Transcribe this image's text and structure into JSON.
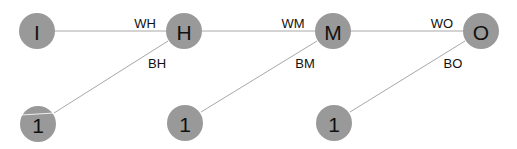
{
  "diagram": {
    "nodes": [
      {
        "id": "I",
        "label": "I",
        "cx": 37,
        "cy": 31,
        "r": 18
      },
      {
        "id": "H",
        "label": "H",
        "cx": 184,
        "cy": 31,
        "r": 18
      },
      {
        "id": "M",
        "label": "M",
        "cx": 333,
        "cy": 31,
        "r": 18
      },
      {
        "id": "O",
        "label": "O",
        "cx": 481,
        "cy": 31,
        "r": 18
      },
      {
        "id": "B1",
        "label": "1",
        "cx": 38,
        "cy": 124,
        "r": 18
      },
      {
        "id": "B2",
        "label": "1",
        "cx": 185,
        "cy": 123,
        "r": 18
      },
      {
        "id": "B3",
        "label": "1",
        "cx": 334,
        "cy": 123,
        "r": 18
      }
    ],
    "edges": [
      {
        "from": "I",
        "to": "H",
        "label": "WH",
        "lx": 145,
        "ly": 23
      },
      {
        "from": "B1",
        "to": "H",
        "label": "BH",
        "lx": 157,
        "ly": 63
      },
      {
        "from": "H",
        "to": "M",
        "label": "WM",
        "lx": 293,
        "ly": 23
      },
      {
        "from": "B2",
        "to": "M",
        "label": "BM",
        "lx": 305,
        "ly": 63
      },
      {
        "from": "M",
        "to": "O",
        "label": "WO",
        "lx": 442,
        "ly": 23
      },
      {
        "from": "B3",
        "to": "O",
        "label": "BO",
        "lx": 453,
        "ly": 63
      }
    ],
    "colors": {
      "node_fill": "#999999",
      "edge_stroke": "#a8a8a8",
      "text": "#111111"
    }
  }
}
